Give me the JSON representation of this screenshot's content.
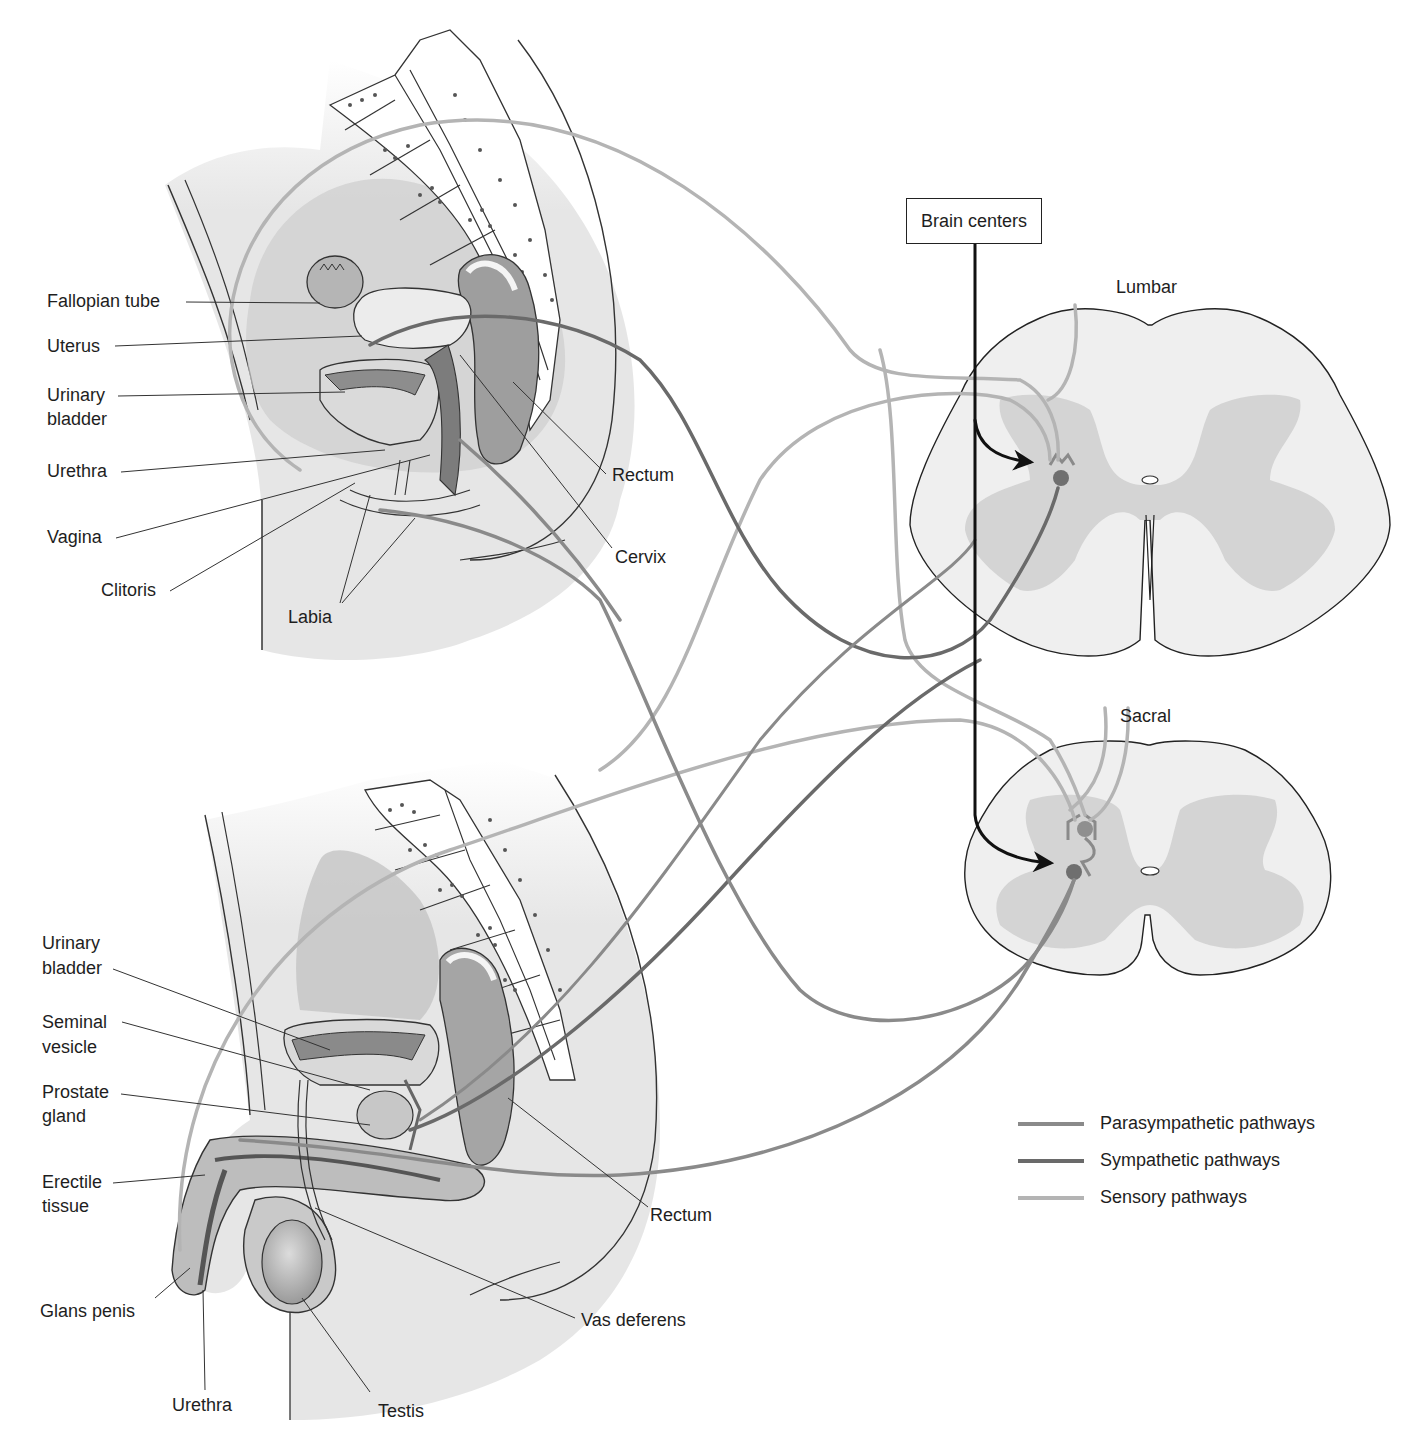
{
  "figure": {
    "brain_box": "Brain centers",
    "spinal_sections": {
      "lumbar": "Lumbar",
      "sacral": "Sacral"
    }
  },
  "female_labels": {
    "fallopian_tube": "Fallopian tube",
    "uterus": "Uterus",
    "urinary_bladder_1": "Urinary",
    "urinary_bladder_2": "bladder",
    "urethra": "Urethra",
    "vagina": "Vagina",
    "clitoris": "Clitoris",
    "labia": "Labia",
    "rectum": "Rectum",
    "cervix": "Cervix"
  },
  "male_labels": {
    "urinary_bladder_1": "Urinary",
    "urinary_bladder_2": "bladder",
    "seminal_vesicle_1": "Seminal",
    "seminal_vesicle_2": "vesicle",
    "prostate_1": "Prostate",
    "prostate_2": "gland",
    "erectile_1": "Erectile",
    "erectile_2": "tissue",
    "glans_penis": "Glans penis",
    "urethra": "Urethra",
    "testis": "Testis",
    "vas_deferens": "Vas deferens",
    "rectum": "Rectum"
  },
  "legend": {
    "items": [
      {
        "label": "Parasympathetic pathways",
        "color": "#8a8a8a"
      },
      {
        "label": "Sympathetic pathways",
        "color": "#6a6a6a"
      },
      {
        "label": "Sensory pathways",
        "color": "#b4b4b4"
      }
    ]
  },
  "colors": {
    "parasympathetic": "#8a8a8a",
    "sympathetic": "#6a6a6a",
    "sensory": "#b4b4b4",
    "descending": "#111111",
    "tissue_light": "#e9e9e9",
    "tissue_mid": "#cfcfcf",
    "tissue_dark": "#a9a9a9",
    "gray_matter": "#d3d3d3",
    "white_matter": "#efefef"
  }
}
